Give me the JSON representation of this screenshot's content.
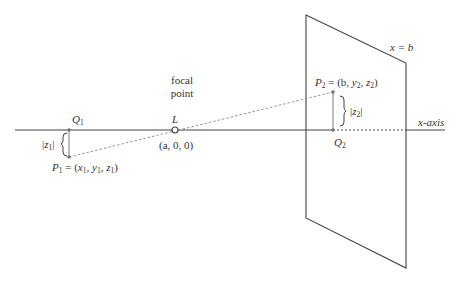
{
  "diagram": {
    "axis": {
      "label": "x-axis"
    },
    "plane": {
      "label": "x = b"
    },
    "focal_point": {
      "caption_line1": "focal",
      "caption_line2": "point",
      "name": "L",
      "coords": "(a, 0, 0)"
    },
    "points": {
      "P1": {
        "name": "P",
        "sub": "1",
        "eq": " = (",
        "c1": "x",
        "s1": "1",
        "c2": "y",
        "s2": "1",
        "c3": "z",
        "s3": "1"
      },
      "Q1": {
        "name": "Q",
        "sub": "1"
      },
      "P2": {
        "name": "P",
        "sub": "2",
        "eq": " = (b, ",
        "c2": "y",
        "s2": "2",
        "c3": "z",
        "s3": "2"
      },
      "Q2": {
        "name": "Q",
        "sub": "2"
      }
    },
    "distances": {
      "z1": {
        "bar_open": "|",
        "var": "z",
        "sub": "1",
        "bar_close": "|"
      },
      "z2": {
        "bar_open": "|",
        "var": "z",
        "sub": "2",
        "bar_close": "|"
      }
    },
    "colors": {
      "line": "#444444",
      "dashed": "#888888",
      "point": "#777777"
    }
  }
}
